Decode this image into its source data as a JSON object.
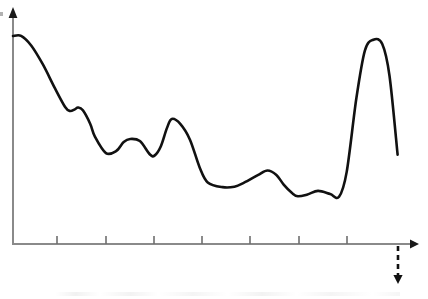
{
  "figure": {
    "title": "",
    "width": 428,
    "height": 299,
    "background_color": "#ffffff"
  },
  "axes": {
    "x_axis": {
      "name": "x-axis",
      "label": "",
      "origin_x": 13,
      "y_position": 244,
      "end_x": 417,
      "arrow": "right-arrow",
      "color": "#8a8a8a",
      "tick_positions": [
        57,
        106,
        154,
        202,
        250,
        299,
        347
      ],
      "tick_labels": [],
      "tick_length": 8
    },
    "y_axis": {
      "name": "y-axis",
      "label": "",
      "x_position": 13,
      "base_y": 245,
      "top_y": 9,
      "arrow": "up-arrow",
      "color": "#8a8a8a",
      "tick_positions": [],
      "tick_labels": []
    }
  },
  "annotations": {
    "projection": {
      "name": "dashed-descent-arrow",
      "style": "dashed",
      "color": "#111111",
      "x": 398,
      "from_y": 246,
      "to_y": 284,
      "arrow": "down-arrow",
      "label": ""
    }
  },
  "chart_data": {
    "type": "line",
    "title": "",
    "xlabel": "",
    "ylabel": "",
    "grid": false,
    "legend": null,
    "legend_position": "none",
    "xlim": [
      0,
      100
    ],
    "ylim": [
      0,
      100
    ],
    "axis_ticks_x": [
      10.9,
      23.0,
      34.9,
      46.8,
      58.7,
      70.8,
      82.7
    ],
    "series": [
      {
        "name": "curve",
        "color": "#111111",
        "line_width": 2.6,
        "style": "solid",
        "x": [
          0.0,
          2.0,
          4.5,
          7.4,
          10.4,
          12.9,
          14.1,
          15.3,
          16.1,
          17.3,
          19.1,
          20.3,
          23.0,
          25.5,
          27.4,
          29.0,
          31.4,
          33.9,
          35.1,
          36.6,
          38.1,
          39.3,
          41.4,
          43.8,
          46.2,
          48.2,
          51.9,
          54.8,
          57.2,
          60.6,
          63.0,
          65.2,
          67.0,
          69.0,
          70.5,
          72.9,
          75.5,
          78.5,
          80.7,
          82.6,
          85.0,
          87.1,
          89.2,
          91.4,
          93.2,
          95.2
        ],
        "y": [
          88.5,
          88.6,
          84.5,
          76.4,
          66.2,
          58.3,
          56.6,
          57.3,
          58.1,
          56.9,
          51.2,
          45.6,
          38.7,
          39.5,
          43.4,
          44.7,
          43.8,
          38.1,
          37.7,
          41.6,
          49.3,
          53.2,
          51.1,
          44.4,
          32.6,
          26.2,
          24.2,
          24.4,
          26.1,
          29.3,
          31.3,
          29.4,
          25.3,
          21.8,
          20.3,
          21.1,
          22.6,
          21.3,
          20.1,
          30.7,
          62.1,
          82.3,
          86.9,
          85.1,
          71.5,
          38.0
        ],
        "notable_points": [
          {
            "name": "start-maximum",
            "x": 0.0,
            "y": 88.5
          },
          {
            "name": "shoulder-bump",
            "x": 16.1,
            "y": 58.1
          },
          {
            "name": "local-minimum-1",
            "x": 23.0,
            "y": 38.7
          },
          {
            "name": "local-maximum-1",
            "x": 29.0,
            "y": 44.7
          },
          {
            "name": "local-minimum-2",
            "x": 35.1,
            "y": 37.7
          },
          {
            "name": "local-maximum-2",
            "x": 41.4,
            "y": 51.1
          },
          {
            "name": "local-minimum-3",
            "x": 51.9,
            "y": 24.2
          },
          {
            "name": "local-maximum-3",
            "x": 63.0,
            "y": 31.3
          },
          {
            "name": "local-minimum-4",
            "x": 70.5,
            "y": 20.3
          },
          {
            "name": "local-maximum-4",
            "x": 75.5,
            "y": 22.6
          },
          {
            "name": "local-minimum-5",
            "x": 80.7,
            "y": 20.1
          },
          {
            "name": "global-peak-right",
            "x": 89.2,
            "y": 86.9
          },
          {
            "name": "axis-crossing",
            "x": 95.2,
            "y": 0.0
          }
        ]
      }
    ]
  }
}
